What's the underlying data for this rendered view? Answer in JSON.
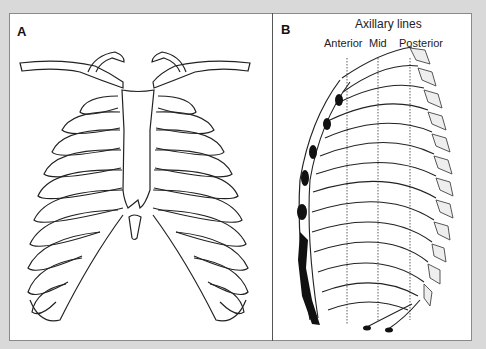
{
  "figure": {
    "panels": [
      {
        "id": "A",
        "label": "A",
        "description": "Anterior view of rib cage with clavicles, sternum and xiphoid process"
      },
      {
        "id": "B",
        "label": "B",
        "description": "Lateral view of rib cage with axillary lines",
        "title": "Axillary lines",
        "lines": [
          {
            "label": "Anterior"
          },
          {
            "label": "Mid"
          },
          {
            "label": "Posterior"
          }
        ]
      }
    ]
  },
  "colors": {
    "background": "#d9d9d9",
    "panel": "#ffffff",
    "stroke": "#222222",
    "cartilage": "#111111"
  }
}
